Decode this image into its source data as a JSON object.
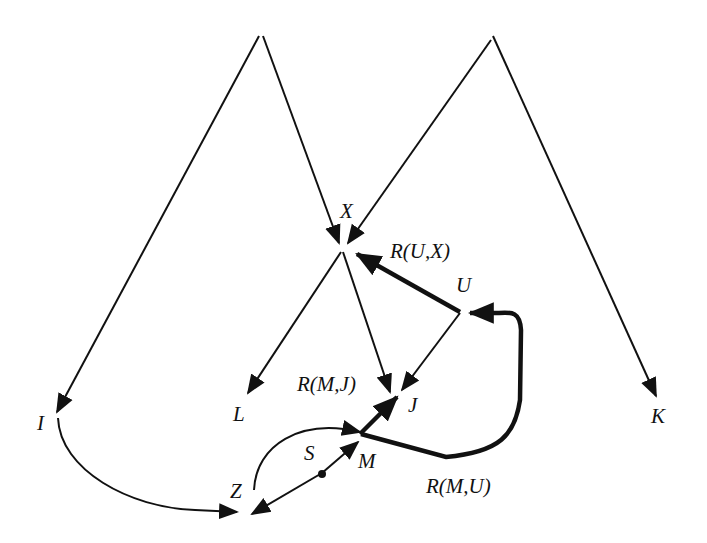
{
  "diagram": {
    "type": "directed-graph",
    "nodes": {
      "X": "X",
      "U": "U",
      "J": "J",
      "L": "L",
      "I": "I",
      "K": "K",
      "Z": "Z",
      "M": "M",
      "S": "S"
    },
    "edge_labels": {
      "r_ux": "R(U,X)",
      "r_mj": "R(M,J)",
      "r_mu": "R(M,U)"
    },
    "edges": [
      {
        "from": "apex-left",
        "to": "I"
      },
      {
        "from": "apex-left",
        "to": "X"
      },
      {
        "from": "apex-right",
        "to": "X"
      },
      {
        "from": "apex-right",
        "to": "K"
      },
      {
        "from": "X",
        "to": "L"
      },
      {
        "from": "X",
        "to": "J"
      },
      {
        "from": "U",
        "to": "X",
        "label": "R(U,X)",
        "bold": true
      },
      {
        "from": "U",
        "to": "J"
      },
      {
        "from": "M",
        "to": "J",
        "label": "R(M,J)",
        "bold": true
      },
      {
        "from": "M",
        "to": "U",
        "label": "R(M,U)",
        "bold": true
      },
      {
        "from": "Z",
        "to": "M"
      },
      {
        "from": "S",
        "to": "M"
      },
      {
        "from": "S",
        "to": "Z"
      },
      {
        "from": "I",
        "to": "Z"
      }
    ],
    "colors": {
      "stroke": "#111111",
      "background": "#ffffff"
    }
  }
}
